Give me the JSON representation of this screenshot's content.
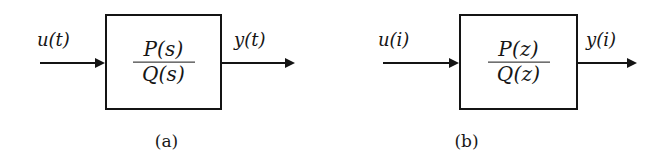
{
  "figure": {
    "background_color": "#ffffff",
    "line_color": "#141414"
  },
  "diagrams": [
    {
      "id": "a",
      "caption": "(a)",
      "input_label": "u(t)",
      "output_label": "y(t)",
      "transfer_function": {
        "numerator": "P(s)",
        "denominator": "Q(s)",
        "variable": "s"
      }
    },
    {
      "id": "b",
      "caption": "(b)",
      "input_label": "u(i)",
      "output_label": "y(i)",
      "transfer_function": {
        "numerator": "P(z)",
        "denominator": "Q(z)",
        "variable": "z"
      }
    }
  ]
}
